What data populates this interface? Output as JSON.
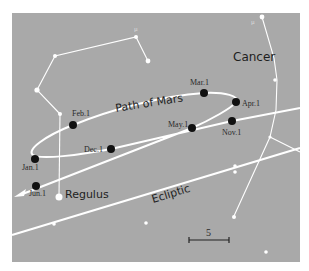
{
  "panel": {
    "background": "#a9a9a9",
    "line_color": "#ffffff",
    "point_color": "#111111"
  },
  "labels": {
    "path": "Path of Mars",
    "ecliptic": "Ecliptic",
    "cancer": "Cancer",
    "regulus": "Regulus",
    "mu_leo": "μ",
    "mu_cnc": "μ",
    "scale": "5"
  },
  "dates": [
    {
      "label": "Feb.1",
      "x": 73,
      "y": 125
    },
    {
      "label": "Mar.1",
      "x": 204,
      "y": 93
    },
    {
      "label": "Apr.1",
      "x": 236,
      "y": 102
    },
    {
      "label": "May.1",
      "x": 192,
      "y": 128
    },
    {
      "label": "Nov.1",
      "x": 232,
      "y": 121
    },
    {
      "label": "Dec.1",
      "x": 111,
      "y": 149
    },
    {
      "label": "Jan.1",
      "x": 35,
      "y": 159
    },
    {
      "label": "Jun.1",
      "x": 36,
      "y": 186
    }
  ]
}
